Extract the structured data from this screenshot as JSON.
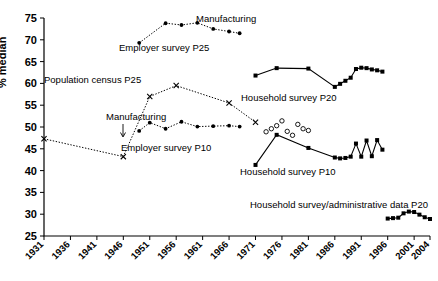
{
  "chart_data": {
    "type": "line",
    "title": "",
    "xlabel": "",
    "ylabel": "% median",
    "xlim": [
      1931,
      2004
    ],
    "ylim": [
      25,
      75
    ],
    "grid": false,
    "legend_position": "inline-annotations",
    "y_ticks": [
      25,
      30,
      35,
      40,
      45,
      50,
      55,
      60,
      65,
      70,
      75
    ],
    "x_ticks": [
      1931,
      1936,
      1941,
      1946,
      1951,
      1956,
      1961,
      1966,
      1971,
      1976,
      1981,
      1986,
      1991,
      1996,
      2001,
      2004
    ],
    "annotations": [
      {
        "text": "Manufacturing",
        "series": "Employer survey P25"
      },
      {
        "text": "Employer survey P25",
        "series": "Employer survey P25"
      },
      {
        "text": "Population census P25",
        "series": "Population census P25"
      },
      {
        "text": "Manufacturing",
        "series": "Employer survey P10"
      },
      {
        "text": "Employer survey P10",
        "series": "Employer survey P10"
      },
      {
        "text": "Household survey P20",
        "series": "Household survey P20"
      },
      {
        "text": "Household survey P10",
        "series": "Household survey P10"
      },
      {
        "text": "Household survey/administrative data P20",
        "series": "Household survey/administrative data P20"
      }
    ],
    "series": [
      {
        "name": "Employer survey P25",
        "marker": "filled-circle",
        "line": "dotted",
        "x": [
          1949,
          1954,
          1957,
          1960,
          1963,
          1966,
          1968
        ],
        "values": [
          69.3,
          73.8,
          73.4,
          73.9,
          72.5,
          71.9,
          71.5
        ]
      },
      {
        "name": "Population census P25",
        "marker": "x",
        "line": "dotted",
        "x": [
          1931,
          1946,
          1951,
          1956,
          1966,
          1971
        ],
        "values": [
          47.3,
          43.2,
          57.0,
          59.5,
          55.5,
          51.1
        ]
      },
      {
        "name": "Employer survey P10",
        "marker": "filled-circle",
        "line": "dotted",
        "x": [
          1949,
          1951,
          1954,
          1957,
          1960,
          1963,
          1966,
          1968
        ],
        "values": [
          49.1,
          51.0,
          49.6,
          51.2,
          50.1,
          50.2,
          50.3,
          50.1
        ]
      },
      {
        "name": "Household survey P20",
        "marker": "filled-square",
        "line": "solid",
        "x": [
          1971,
          1975,
          1981,
          1986,
          1987,
          1988,
          1989,
          1990,
          1991,
          1992,
          1993,
          1994,
          1995
        ],
        "values": [
          61.8,
          63.5,
          63.4,
          59.2,
          59.9,
          60.6,
          61.3,
          63.3,
          63.6,
          63.5,
          63.2,
          63.0,
          62.7
        ]
      },
      {
        "name": "Household survey P10",
        "marker": "filled-square",
        "line": "solid",
        "x": [
          1971,
          1975,
          1981,
          1986,
          1987,
          1988,
          1989,
          1990,
          1991,
          1992,
          1993,
          1994,
          1995
        ],
        "values": [
          41.3,
          48.2,
          45.2,
          43.0,
          42.8,
          42.9,
          43.2,
          46.2,
          43.2,
          46.9,
          43.3,
          47.0,
          44.8
        ]
      },
      {
        "name": "Household survey P10 (alternative estimates)",
        "marker": "open-circle",
        "line": "none",
        "x": [
          1973,
          1974,
          1975,
          1976,
          1977,
          1978,
          1979,
          1980,
          1981
        ],
        "values": [
          48.9,
          49.6,
          50.3,
          51.4,
          49.0,
          48.1,
          50.6,
          49.6,
          49.2
        ]
      },
      {
        "name": "Household survey/administrative data P20",
        "marker": "filled-square",
        "line": "solid",
        "x": [
          1996,
          1997,
          1998,
          1999,
          2000,
          2001,
          2002,
          2003,
          2004
        ],
        "values": [
          29.0,
          29.1,
          29.2,
          30.2,
          30.6,
          30.5,
          29.9,
          29.3,
          28.9
        ]
      }
    ]
  },
  "axis": {
    "y_label": "% median",
    "y_ticks": [
      "25",
      "30",
      "35",
      "40",
      "45",
      "50",
      "55",
      "60",
      "65",
      "70",
      "75"
    ],
    "x_ticks": [
      "1931",
      "1936",
      "1941",
      "1946",
      "1951",
      "1956",
      "1961",
      "1966",
      "1971",
      "1976",
      "1981",
      "1986",
      "1991",
      "1996",
      "2001",
      "2004"
    ]
  },
  "labels": {
    "manufacturing_top": "Manufacturing",
    "employer_p25": "Employer survey P25",
    "population_census_p25": "Population census P25",
    "manufacturing_mid": "Manufacturing",
    "employer_p10": "Employer survey P10",
    "household_p20": "Household survey P20",
    "household_p10": "Household survey P10",
    "household_admin_p20": "Household survey/administrative data P20"
  }
}
